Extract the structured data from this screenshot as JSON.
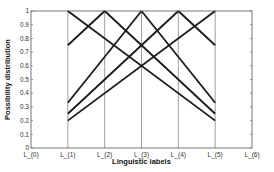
{
  "chart_data": {
    "type": "line",
    "title": "",
    "xlabel": "Linguistic labels",
    "ylabel": "Possibility distribution",
    "categories": [
      "L_{0}",
      "L_{1}",
      "L_{2}",
      "L_{3}",
      "L_{4}",
      "L_{5}",
      "L_{6}"
    ],
    "x_tick_labels": [
      "L_{0}",
      "L_{1}",
      "L_{2}",
      "L_{3}",
      "L_{4}",
      "L_{5}",
      "L_{6}"
    ],
    "y_ticks": [
      0,
      0.1,
      0.2,
      0.3,
      0.4,
      0.5,
      0.6,
      0.7,
      0.8,
      0.9,
      1
    ],
    "ylim": [
      0,
      1
    ],
    "xlim": [
      0,
      6
    ],
    "grid": "vertical lines at L_{1}..L_{5}",
    "legend": null,
    "series": [
      {
        "name": "desc from L1",
        "x": [
          1,
          5
        ],
        "values": [
          1,
          0.2
        ]
      },
      {
        "name": "asc to L2",
        "x": [
          1,
          2
        ],
        "values": [
          0.75,
          1
        ]
      },
      {
        "name": "desc from L2",
        "x": [
          2,
          5
        ],
        "values": [
          1,
          0.25
        ]
      },
      {
        "name": "asc to L3",
        "x": [
          1,
          3
        ],
        "values": [
          0.33,
          1
        ]
      },
      {
        "name": "desc from L3",
        "x": [
          3,
          5
        ],
        "values": [
          1,
          0.33
        ]
      },
      {
        "name": "asc to L4",
        "x": [
          1,
          4
        ],
        "values": [
          0.25,
          1
        ]
      },
      {
        "name": "desc from L4",
        "x": [
          4,
          5
        ],
        "values": [
          1,
          0.75
        ]
      },
      {
        "name": "asc to L5",
        "x": [
          1,
          5
        ],
        "values": [
          0.2,
          1
        ]
      }
    ]
  },
  "layout": {
    "plot": {
      "left": 31,
      "right": 252,
      "top": 11,
      "bottom": 148
    },
    "colors": {
      "axis": "#555555",
      "grid": "#777777",
      "line": "#1a1a1a"
    }
  }
}
